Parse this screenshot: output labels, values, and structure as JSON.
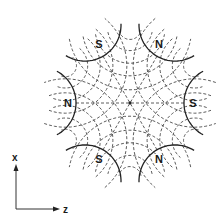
{
  "diagram": {
    "title": "",
    "type": "sextupole magnet cross-section with field lines",
    "center": {
      "x": 130,
      "y": 103
    },
    "pole_tip_radius": 54,
    "poles": [
      {
        "label": "N",
        "angle_deg": 180,
        "label_x": 68,
        "label_y": 107
      },
      {
        "label": "S",
        "angle_deg": 120,
        "label_x": 99,
        "label_y": 48
      },
      {
        "label": "N",
        "angle_deg": 60,
        "label_x": 159,
        "label_y": 48
      },
      {
        "label": "S",
        "angle_deg": 0,
        "label_x": 193,
        "label_y": 107
      },
      {
        "label": "N",
        "angle_deg": 300,
        "label_x": 159,
        "label_y": 163
      },
      {
        "label": "S",
        "angle_deg": 240,
        "label_x": 99,
        "label_y": 163
      }
    ],
    "axes": {
      "vertical_label": "x",
      "horizontal_label": "z",
      "origin": {
        "x": 16,
        "y": 209
      }
    },
    "colors": {
      "line": "#222222",
      "background": "#ffffff"
    }
  }
}
